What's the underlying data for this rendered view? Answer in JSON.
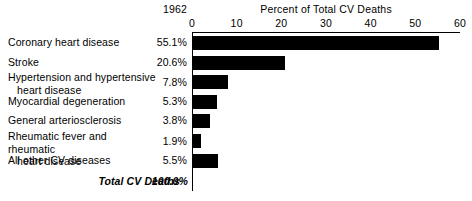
{
  "year": "1962",
  "chart_data": {
    "type": "bar",
    "orientation": "horizontal",
    "title": "Percent of Total CV Deaths",
    "subtitle": "1962",
    "xlabel": "Percent of Total CV Deaths",
    "ylabel": "",
    "xlim": [
      0,
      60
    ],
    "xticks": [
      0,
      10,
      20,
      30,
      40,
      50,
      60
    ],
    "xtick_labels": [
      "0",
      "10",
      "20",
      "30",
      "40",
      "50",
      "60"
    ],
    "grid": false,
    "legend": false,
    "bar_color": "#000000",
    "categories": [
      "Coronary heart disease",
      "Stroke",
      "Hypertension and hypertensive heart disease",
      "Myocardial degeneration",
      "General arteriosclerosis",
      "Rheumatic fever and rheumatic heart disease",
      "All other CV diseases"
    ],
    "values": [
      55.1,
      20.6,
      7.8,
      5.3,
      3.8,
      1.9,
      5.5
    ],
    "value_labels": [
      "55.1%",
      "20.6%",
      "7.8%",
      "5.3%",
      "3.8%",
      "1.9%",
      "5.5%"
    ],
    "total_label": "Total CV Deaths",
    "total_value": "100.0%"
  },
  "rows": [
    {
      "label_line1": "Coronary heart disease",
      "label_line2": "",
      "value": "55.1%",
      "amount": 55.1
    },
    {
      "label_line1": "Stroke",
      "label_line2": "",
      "value": "20.6%",
      "amount": 20.6
    },
    {
      "label_line1": "Hypertension and hypertensive",
      "label_line2": "heart disease",
      "value": "7.8%",
      "amount": 7.8
    },
    {
      "label_line1": "Myocardial degeneration",
      "label_line2": "",
      "value": "5.3%",
      "amount": 5.3
    },
    {
      "label_line1": "General arteriosclerosis",
      "label_line2": "",
      "value": "3.8%",
      "amount": 3.8
    },
    {
      "label_line1": "Rheumatic fever and rheumatic",
      "label_line2": "heart disease",
      "value": "1.9%",
      "amount": 1.9
    },
    {
      "label_line1": "All other CV diseases",
      "label_line2": "",
      "value": "5.5%",
      "amount": 5.5
    }
  ],
  "total": {
    "label": "Total CV Deaths",
    "value": "100.0%"
  }
}
